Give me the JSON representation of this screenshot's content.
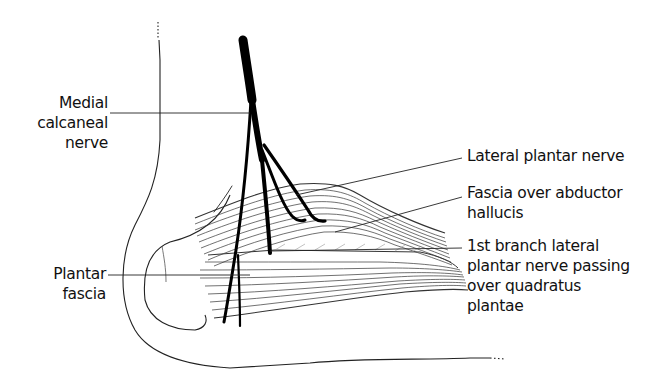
{
  "diagram": {
    "labels": {
      "medial_calcaneal_nerve": [
        "Medial",
        "calcaneal",
        "nerve"
      ],
      "lateral_plantar_nerve": [
        "Lateral plantar nerve"
      ],
      "fascia_over_abductor_hallucis": [
        "Fascia over abductor",
        "hallucis"
      ],
      "first_branch_lateral_plantar_nerve": [
        "1st branch lateral",
        "plantar nerve passing",
        "over quadratus",
        "plantae"
      ],
      "plantar_fascia": [
        "Plantar",
        "fascia"
      ]
    },
    "colors": {
      "ink": "#111111",
      "background": "#ffffff"
    }
  }
}
